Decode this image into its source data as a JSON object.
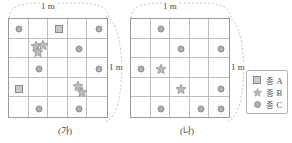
{
  "figure": {
    "dimension_label_top": "1 m",
    "dimension_label_side": "1 m"
  },
  "panels": [
    {
      "id": "ga",
      "caption": "(가)",
      "grid": {
        "rows": 5,
        "cols": 5
      },
      "marks": [
        {
          "species": "C",
          "symbol": "circle",
          "row": 1,
          "col": 1,
          "dx": 0,
          "dy": 0
        },
        {
          "species": "A",
          "symbol": "square",
          "row": 1,
          "col": 3,
          "dx": 0,
          "dy": 0
        },
        {
          "species": "C",
          "symbol": "circle",
          "row": 1,
          "col": 5,
          "dx": 0,
          "dy": 0
        },
        {
          "species": "B",
          "symbol": "star",
          "row": 2,
          "col": 2,
          "dx": -3.5,
          "dy": -3.5
        },
        {
          "species": "B",
          "symbol": "star",
          "row": 2,
          "col": 2,
          "dx": 3.5,
          "dy": -4
        },
        {
          "species": "B",
          "symbol": "star",
          "row": 2,
          "col": 2,
          "dx": -1,
          "dy": 3
        },
        {
          "species": "C",
          "symbol": "circle",
          "row": 2,
          "col": 4,
          "dx": 0,
          "dy": 0
        },
        {
          "species": "C",
          "symbol": "circle",
          "row": 3,
          "col": 2,
          "dx": 0,
          "dy": 0
        },
        {
          "species": "C",
          "symbol": "circle",
          "row": 3,
          "col": 5,
          "dx": 0,
          "dy": 0
        },
        {
          "species": "A",
          "symbol": "square",
          "row": 4,
          "col": 1,
          "dx": 0,
          "dy": 0
        },
        {
          "species": "B",
          "symbol": "star",
          "row": 4,
          "col": 4,
          "dx": -1,
          "dy": -3.5
        },
        {
          "species": "B",
          "symbol": "star",
          "row": 4,
          "col": 4,
          "dx": 3,
          "dy": 3
        },
        {
          "species": "C",
          "symbol": "circle",
          "row": 5,
          "col": 2,
          "dx": 0,
          "dy": 0
        },
        {
          "species": "C",
          "symbol": "circle",
          "row": 5,
          "col": 4,
          "dx": 0,
          "dy": 0
        }
      ],
      "counts": {
        "A": 2,
        "B": 5,
        "C": 7
      }
    },
    {
      "id": "na",
      "caption": "(나)",
      "grid": {
        "rows": 5,
        "cols": 5
      },
      "marks": [
        {
          "species": "C",
          "symbol": "circle",
          "row": 1,
          "col": 2,
          "dx": 0,
          "dy": 0
        },
        {
          "species": "C",
          "symbol": "circle",
          "row": 2,
          "col": 3,
          "dx": 0,
          "dy": 0
        },
        {
          "species": "C",
          "symbol": "circle",
          "row": 2,
          "col": 5,
          "dx": 0,
          "dy": 0
        },
        {
          "species": "C",
          "symbol": "circle",
          "row": 3,
          "col": 1,
          "dx": 0,
          "dy": 0
        },
        {
          "species": "B",
          "symbol": "star",
          "row": 3,
          "col": 2,
          "dx": 0,
          "dy": 0
        },
        {
          "species": "B",
          "symbol": "star",
          "row": 4,
          "col": 3,
          "dx": 0,
          "dy": 0
        },
        {
          "species": "C",
          "symbol": "circle",
          "row": 4,
          "col": 5,
          "dx": 0,
          "dy": 0
        },
        {
          "species": "C",
          "symbol": "circle",
          "row": 5,
          "col": 2,
          "dx": 0,
          "dy": 0
        },
        {
          "species": "C",
          "symbol": "circle",
          "row": 5,
          "col": 4,
          "dx": 0,
          "dy": 0
        },
        {
          "species": "C",
          "symbol": "circle",
          "row": 5,
          "col": 5,
          "dx": 0,
          "dy": 0
        }
      ],
      "counts": {
        "A": 0,
        "B": 2,
        "C": 8
      }
    }
  ],
  "legend": {
    "items": [
      {
        "symbol": "square",
        "icon_name": "square-icon",
        "label": "종 A"
      },
      {
        "symbol": "star",
        "icon_name": "star-icon",
        "label": "종 B"
      },
      {
        "symbol": "circle",
        "icon_name": "circle-icon",
        "label": "종 C"
      }
    ]
  },
  "colors": {
    "mark_fill": "#b0b0b0",
    "mark_stroke": "#8d8d8d",
    "square_fill": "#c9c9c9",
    "grid_line": "#bdbdbd",
    "grid_border": "#9a9a9a",
    "brace": "#bfbfbf",
    "text": "#4a4a4a"
  }
}
